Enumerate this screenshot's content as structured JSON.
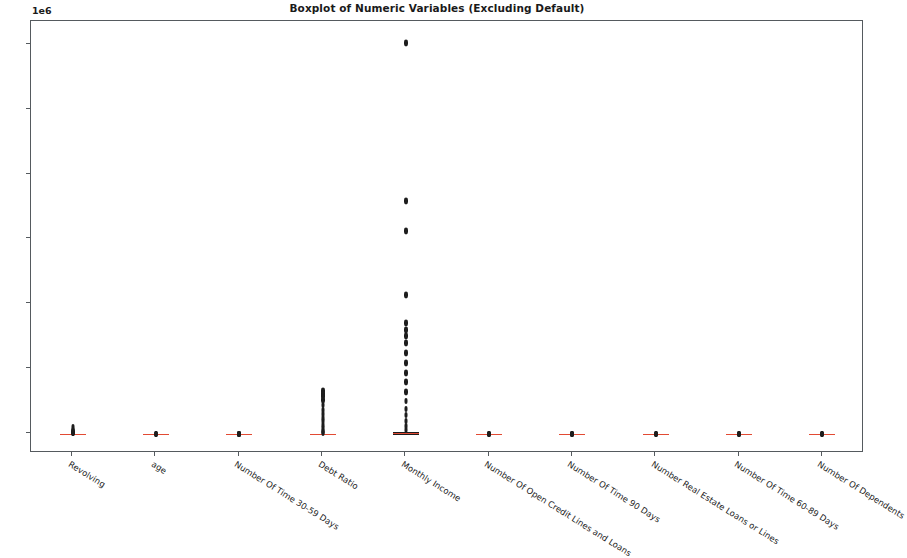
{
  "chart_data": {
    "type": "box",
    "title": "Boxplot of Numeric Variables (Excluding Default)",
    "xlabel": "",
    "ylabel": "",
    "y_offset_text": "1e6",
    "y_offset_multiplier": 1000000,
    "ylim": [
      -150000,
      3180000
    ],
    "grid": false,
    "legend": null,
    "y_ticks": [
      {
        "value": 0.0,
        "label": "0.0"
      },
      {
        "value": 0.5,
        "label": "0.5"
      },
      {
        "value": 1.0,
        "label": "1.0"
      },
      {
        "value": 1.5,
        "label": "1.5"
      },
      {
        "value": 2.0,
        "label": "2.0"
      },
      {
        "value": 2.5,
        "label": "2.5"
      },
      {
        "value": 3.0,
        "label": "3.0"
      }
    ],
    "categories": [
      "Revolving",
      "age",
      "Number Of Time 30-59 Days",
      "Debt Ratio",
      "Monthly Income",
      "Number Of Open Credit Lines and Loans",
      "Number Of Time 90 Days",
      "Number Real Estate Loans or Lines",
      "Number Of Time 60-89 Days",
      "Number Of Dependents"
    ],
    "boxes": [
      {
        "name": "Revolving",
        "whisker_low": 0,
        "q1": 0,
        "median": 0.154,
        "q3": 0.559,
        "whisker_high": 1.4,
        "fliers": [
          2000,
          3500,
          5500,
          8000,
          11000,
          14500,
          18000,
          22000,
          29000,
          50708
        ]
      },
      {
        "name": "age",
        "whisker_low": 21,
        "q1": 41,
        "median": 52,
        "q3": 63,
        "whisker_high": 96,
        "fliers": [
          98,
          101,
          103,
          107,
          109
        ]
      },
      {
        "name": "Number Of Time 30-59 Days",
        "whisker_low": 0,
        "q1": 0,
        "median": 0,
        "q3": 0,
        "whisker_high": 0,
        "fliers": [
          1,
          2,
          3,
          4,
          5,
          6,
          7,
          8,
          96,
          98
        ]
      },
      {
        "name": "Debt Ratio",
        "whisker_low": 0,
        "q1": 0.175,
        "median": 0.366,
        "q3": 0.868,
        "whisker_high": 1.9,
        "fliers": [
          3000,
          9000,
          20000,
          42000,
          68000,
          96000,
          120000,
          150000,
          185000,
          220000,
          258000,
          290000,
          307000,
          329664
        ]
      },
      {
        "name": "Monthly Income",
        "whisker_low": 0,
        "q1": 3400,
        "median": 5400,
        "q3": 8249,
        "whisker_high": 15500,
        "fliers": [
          30000,
          60000,
          95000,
          140000,
          190000,
          250000,
          320000,
          400000,
          470000,
          540000,
          620000,
          700000,
          750000,
          800000,
          850000,
          1070000,
          1560000,
          1794060,
          3008750
        ]
      },
      {
        "name": "Number Of Open Credit Lines and Loans",
        "whisker_low": 0,
        "q1": 5,
        "median": 8,
        "q3": 11,
        "whisker_high": 20,
        "fliers": [
          24,
          30,
          36,
          43,
          49,
          57,
          58
        ]
      },
      {
        "name": "Number Of Time 90 Days",
        "whisker_low": 0,
        "q1": 0,
        "median": 0,
        "q3": 0,
        "whisker_high": 0,
        "fliers": [
          1,
          2,
          3,
          5,
          8,
          17,
          96,
          98
        ]
      },
      {
        "name": "Number Real Estate Loans or Lines",
        "whisker_low": 0,
        "q1": 0,
        "median": 1,
        "q3": 2,
        "whisker_high": 4,
        "fliers": [
          6,
          9,
          13,
          20,
          29,
          54
        ]
      },
      {
        "name": "Number Of Time 60-89 Days",
        "whisker_low": 0,
        "q1": 0,
        "median": 0,
        "q3": 0,
        "whisker_high": 0,
        "fliers": [
          1,
          2,
          3,
          5,
          11,
          96,
          98
        ]
      },
      {
        "name": "Number Of Dependents",
        "whisker_low": 0,
        "q1": 0,
        "median": 0,
        "q3": 1,
        "whisker_high": 2,
        "fliers": [
          4,
          6,
          8,
          10,
          13,
          20
        ]
      }
    ]
  }
}
